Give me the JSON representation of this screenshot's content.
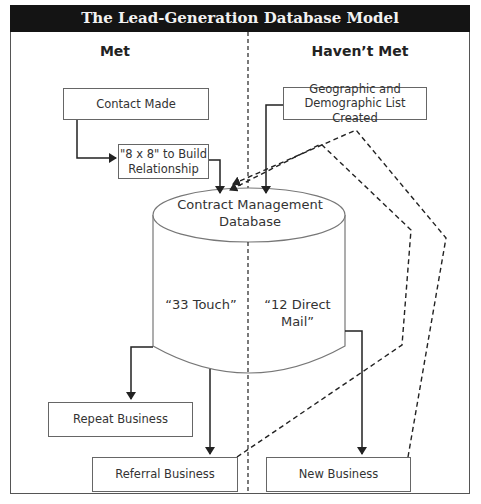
{
  "title": "The Lead-Generation Database Model",
  "columns": {
    "left": "Met",
    "right": "Haven’t Met"
  },
  "nodes": {
    "contact_made": "Contact Made",
    "eight_by_eight": {
      "line1": "\"8 x 8\" to Build",
      "line2": "Relationship"
    },
    "geo_list": {
      "line1": "Geographic and",
      "line2": "Demographic List Created"
    },
    "database": {
      "line1": "Contract Management",
      "line2": "Database"
    },
    "touch33": "“33 Touch”",
    "direct_mail": {
      "line1": "“12 Direct",
      "line2": "Mail”"
    },
    "repeat_business": "Repeat Business",
    "referral_business": "Referral Business",
    "new_business": "New Business"
  },
  "edges": [
    {
      "from": "Contact Made",
      "to": "\"8 x 8\" to Build Relationship",
      "style": "solid"
    },
    {
      "from": "\"8 x 8\" to Build Relationship",
      "to": "Contract Management Database",
      "style": "solid"
    },
    {
      "from": "Geographic and Demographic List Created",
      "to": "Contract Management Database",
      "style": "solid"
    },
    {
      "from": "Contract Management Database",
      "to": "Repeat Business",
      "style": "solid"
    },
    {
      "from": "Contract Management Database",
      "to": "Referral Business",
      "style": "solid"
    },
    {
      "from": "Contract Management Database",
      "to": "New Business",
      "style": "solid"
    },
    {
      "from": "Referral Business",
      "to": "Contract Management Database",
      "style": "dashed"
    },
    {
      "from": "New Business",
      "to": "Contract Management Database",
      "style": "dashed"
    }
  ]
}
